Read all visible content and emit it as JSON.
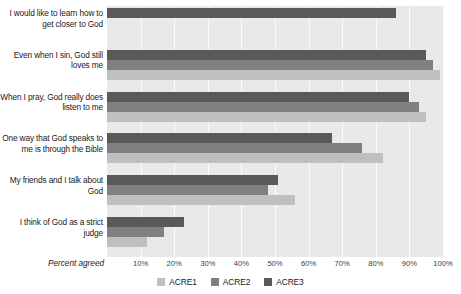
{
  "chart_data": {
    "type": "bar",
    "orientation": "horizontal",
    "title": "",
    "xlabel": "Percent agreed",
    "ylabel": "",
    "xlim": [
      0,
      100
    ],
    "xticks": [
      "10%",
      "20%",
      "30%",
      "40%",
      "50%",
      "60%",
      "70%",
      "80%",
      "90%",
      "100%"
    ],
    "xtick_values": [
      10,
      20,
      30,
      40,
      50,
      60,
      70,
      80,
      90,
      100
    ],
    "grid": true,
    "legend_position": "bottom-center",
    "categories": [
      "I would like to learn how to get closer to God",
      "Even when I sin, God still loves me",
      "When I pray, God really does listen to me",
      "One way that God speaks to me is through the Bible",
      "My friends and I talk about God",
      "I think of God as a strict judge"
    ],
    "category_lines": [
      [
        "I would like to learn how to",
        "get closer to God"
      ],
      [
        "Even when I sin, God still",
        "loves me"
      ],
      [
        "When I pray, God really does",
        "listen to me"
      ],
      [
        "One way that God speaks to",
        "me is through the Bible"
      ],
      [
        "My friends and I talk about",
        "God"
      ],
      [
        "I think of God as a strict",
        "judge"
      ]
    ],
    "series": [
      {
        "name": "ACRE1",
        "color": "#bfbfbf",
        "values": [
          null,
          99,
          95,
          82,
          56,
          12
        ]
      },
      {
        "name": "ACRE2",
        "color": "#808080",
        "values": [
          null,
          97,
          93,
          76,
          48,
          17
        ]
      },
      {
        "name": "ACRE3",
        "color": "#595959",
        "values": [
          86,
          95,
          90,
          67,
          51,
          23
        ]
      }
    ]
  },
  "legend": {
    "items": [
      {
        "label": "ACRE1",
        "color": "#bfbfbf"
      },
      {
        "label": "ACRE2",
        "color": "#808080"
      },
      {
        "label": "ACRE3",
        "color": "#595959"
      }
    ]
  },
  "colors": {
    "plot_background": "#e9e9e9",
    "gridline": "#fbfbfb",
    "text": "#1a1a1a",
    "page_background": "#ffffff"
  }
}
